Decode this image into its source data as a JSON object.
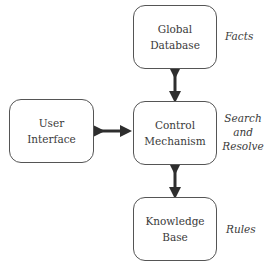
{
  "diagram": {
    "nodes": {
      "global_database": {
        "line1": "Global",
        "line2": "Database"
      },
      "user_interface": {
        "line1": "User",
        "line2": "Interface"
      },
      "control_mechanism": {
        "line1": "Control",
        "line2": "Mechanism"
      },
      "knowledge_base": {
        "line1": "Knowledge",
        "line2": "Base"
      }
    },
    "annotations": {
      "facts": "Facts",
      "search": "Search",
      "and": "and",
      "resolve": "Resolve",
      "rules": "Rules"
    },
    "edges": [
      {
        "from": "global_database",
        "to": "control_mechanism",
        "type": "bidirectional"
      },
      {
        "from": "user_interface",
        "to": "control_mechanism",
        "type": "bidirectional"
      },
      {
        "from": "control_mechanism",
        "to": "knowledge_base",
        "type": "bidirectional"
      }
    ],
    "colors": {
      "stroke": "#555555",
      "arrow": "#2e2e2e",
      "text": "#3a3a3a"
    }
  }
}
